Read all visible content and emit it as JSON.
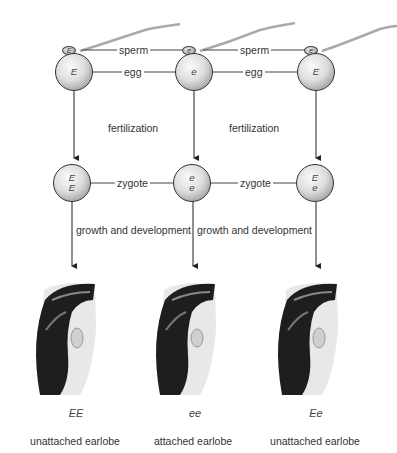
{
  "diagram": {
    "labels": {
      "sperm": "sperm",
      "egg": "egg",
      "fertilization": "fertilization",
      "zygote": "zygote",
      "growth": "growth and development"
    },
    "columns": [
      {
        "sperm_allele": "E",
        "egg_allele": "E",
        "zygote_alleles": [
          "E",
          "E"
        ],
        "genotype": "EE",
        "phenotype": "unattached earlobe"
      },
      {
        "sperm_allele": "e",
        "egg_allele": "e",
        "zygote_alleles": [
          "e",
          "e"
        ],
        "genotype": "ee",
        "phenotype": "attached earlobe"
      },
      {
        "sperm_allele": "e",
        "egg_allele": "E",
        "zygote_alleles": [
          "E",
          "e"
        ],
        "genotype": "Ee",
        "phenotype": "unattached earlobe"
      }
    ]
  }
}
